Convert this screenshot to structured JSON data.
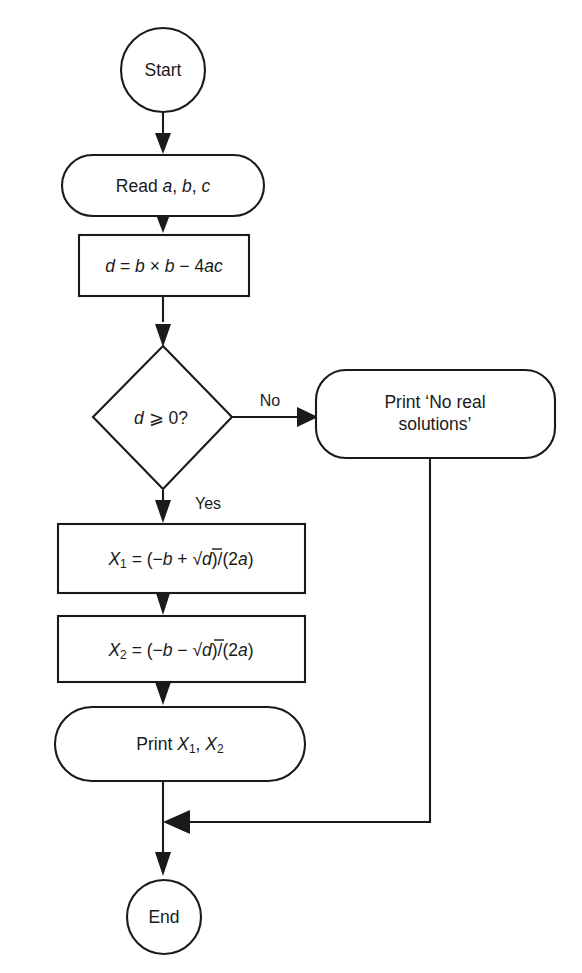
{
  "diagram": {
    "stroke_color": "#1a1a1a",
    "background_color": "#ffffff",
    "nodes": {
      "start": {
        "label": "Start",
        "shape": "circle"
      },
      "read": {
        "label": "Read a, b, c",
        "label_plain": "Read a, b, c",
        "shape": "stadium",
        "text_static": "Read ",
        "var_a": "a",
        "comma1": ", ",
        "var_b": "b",
        "comma2": ", ",
        "var_c": "c"
      },
      "discriminant": {
        "label": "d = b × b − 4ac",
        "shape": "rectangle",
        "var_d": "d",
        "eq": " = ",
        "var_b1": "b",
        "times": " × ",
        "var_b2": "b",
        "minus": " − ",
        "num4": "4",
        "var_ac": "ac"
      },
      "decision": {
        "label": "d ⩾ 0?",
        "shape": "diamond",
        "var_d": "d",
        "operator": " ⩾ ",
        "value": "0?"
      },
      "no_real": {
        "label": "Print ‘No real solutions’",
        "shape": "rounded-rectangle",
        "line1": "Print ‘No real",
        "line2": "solutions’"
      },
      "x1": {
        "label": "X1 = (−b + √d)/(2a)",
        "shape": "rectangle",
        "var_x": "X",
        "subscript": "1",
        "eq": " = (−",
        "var_b": "b",
        "op": " + ",
        "radical": "√",
        "var_d": "d",
        "tail": ")/(2",
        "var_a": "a",
        "close": ")"
      },
      "x2": {
        "label": "X2 = (−b − √d)/(2a)",
        "shape": "rectangle",
        "var_x": "X",
        "subscript": "2",
        "eq": " = (−",
        "var_b": "b",
        "op": " − ",
        "radical": "√",
        "var_d": "d",
        "tail": ")/(2",
        "var_a": "a",
        "close": ")"
      },
      "print_roots": {
        "label": "Print X1, X2",
        "shape": "stadium",
        "text_static": "Print ",
        "var_x1": "X",
        "sub1": "1",
        "comma": ", ",
        "var_x2": "X",
        "sub2": "2"
      },
      "end": {
        "label": "End",
        "shape": "circle"
      }
    },
    "edges": {
      "no_label": "No",
      "yes_label": "Yes"
    }
  }
}
